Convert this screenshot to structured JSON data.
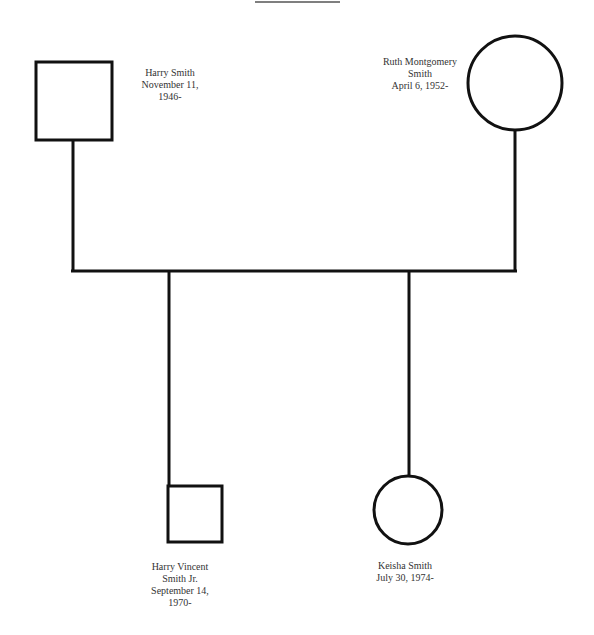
{
  "diagram": {
    "type": "genogram",
    "people": [
      {
        "id": "harry",
        "name": "Harry Smith",
        "line2": "November 11,",
        "line3": "1946-",
        "sex": "male",
        "generation": 1
      },
      {
        "id": "ruth",
        "name": "Ruth Montgomery",
        "line2": "Smith",
        "line3": "April 6, 1952-",
        "sex": "female",
        "generation": 1
      },
      {
        "id": "harry_jr",
        "name": "Harry Vincent",
        "line2": "Smith Jr.",
        "line3": "September 14,",
        "line4": "1970-",
        "sex": "male",
        "generation": 2
      },
      {
        "id": "keisha",
        "name": "Keisha Smith",
        "line2": "July 30, 1974-",
        "sex": "female",
        "generation": 2
      }
    ],
    "relations": [
      {
        "type": "marriage",
        "from": "harry",
        "to": "ruth"
      },
      {
        "type": "child",
        "parents": [
          "harry",
          "ruth"
        ],
        "child": "harry_jr"
      },
      {
        "type": "child",
        "parents": [
          "harry",
          "ruth"
        ],
        "child": "keisha"
      }
    ],
    "line_color": "#111111"
  }
}
